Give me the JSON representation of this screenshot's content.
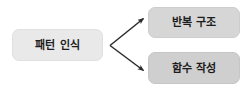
{
  "diagram": {
    "type": "flow-diagram",
    "direction": "left-to-right",
    "background_color": "#ffffff",
    "nodes": [
      {
        "id": "source",
        "label": "패턴 인식",
        "role": "source",
        "fill_color": "#e9e9e9",
        "text_color": "#1c1c1c"
      },
      {
        "id": "target-top",
        "label": "반복 구조",
        "role": "target",
        "fill_color": "#d6d6d6",
        "text_color": "#1c1c1c"
      },
      {
        "id": "target-bottom",
        "label": "함수 작성",
        "role": "target",
        "fill_color": "#cfcfcf",
        "text_color": "#1c1c1c"
      }
    ],
    "edges": [
      {
        "id": "edge-source-to-top",
        "from": "source",
        "to": "target-top",
        "arrowhead": "filled-triangle",
        "color": "#2b2b2b"
      },
      {
        "id": "edge-source-to-bottom",
        "from": "source",
        "to": "target-bottom",
        "arrowhead": "filled-triangle",
        "color": "#2b2b2b"
      }
    ]
  }
}
